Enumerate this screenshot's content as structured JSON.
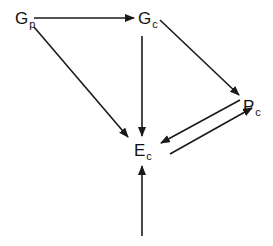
{
  "diagram": {
    "type": "directed-graph",
    "nodes": {
      "Gp": {
        "base": "G",
        "sub": "p",
        "x": 15,
        "y": 10
      },
      "Gc": {
        "base": "G",
        "sub": "c",
        "x": 138,
        "y": 10
      },
      "Pc": {
        "base": "P",
        "sub": "c",
        "x": 243,
        "y": 98
      },
      "Ec": {
        "base": "E",
        "sub": "c",
        "x": 134,
        "y": 142
      }
    },
    "edges": [
      {
        "from": "Gp",
        "to": "Gc"
      },
      {
        "from": "Gp",
        "to": "Ec"
      },
      {
        "from": "Gc",
        "to": "Ec"
      },
      {
        "from": "Gc",
        "to": "Pc"
      },
      {
        "from": "Pc",
        "to": "Ec"
      },
      {
        "from": "Ec",
        "to": "Pc"
      },
      {
        "from": "external-input",
        "to": "Ec"
      }
    ],
    "colors": {
      "stroke": "#1a1a1a",
      "text": "#111111",
      "background": "#ffffff"
    }
  }
}
